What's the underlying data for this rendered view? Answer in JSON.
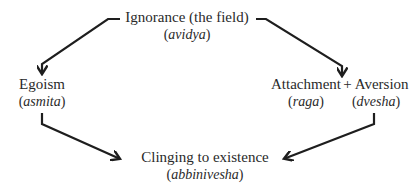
{
  "diagram": {
    "nodes": {
      "ignorance": {
        "label": "Ignorance (the field)",
        "term": "avidya"
      },
      "egoism": {
        "label": "Egoism",
        "term": "asmita"
      },
      "attachment": {
        "label": "Attachment",
        "term": "raga"
      },
      "aversion": {
        "label": "+ Aversion",
        "term": "dvesha"
      },
      "clinging": {
        "label": "Clinging to existence",
        "term": "abbinivesha"
      }
    },
    "edges": [
      {
        "from": "ignorance",
        "to": "egoism"
      },
      {
        "from": "ignorance",
        "to": "attachment_aversion"
      },
      {
        "from": "egoism",
        "to": "clinging"
      },
      {
        "from": "attachment_aversion",
        "to": "clinging"
      }
    ],
    "colors": {
      "text": "#2a2a2a",
      "arrow": "#1e1e1e",
      "background": "#ffffff"
    }
  }
}
